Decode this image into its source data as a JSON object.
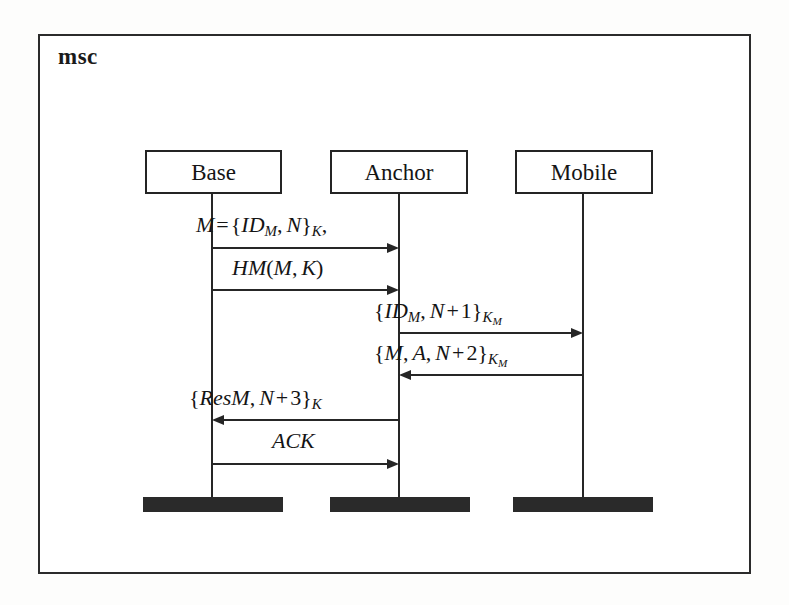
{
  "figure": {
    "kind": "message-sequence-chart",
    "frame_label": "msc"
  },
  "instances": [
    {
      "id": "base",
      "label": "Base",
      "box_x": 145,
      "box_y": 150,
      "box_w": 137,
      "lifeline_x": 212,
      "term_x": 143,
      "term_w": 140
    },
    {
      "id": "anchor",
      "label": "Anchor",
      "box_x": 330,
      "box_y": 150,
      "box_w": 138,
      "lifeline_x": 399,
      "term_x": 330,
      "term_w": 140
    },
    {
      "id": "mobile",
      "label": "Mobile",
      "box_x": 515,
      "box_y": 150,
      "box_w": 138,
      "lifeline_x": 583,
      "term_x": 513,
      "term_w": 140
    }
  ],
  "lifeline": {
    "top": 194,
    "bottom": 497
  },
  "terminators": {
    "top": 497,
    "height": 15
  },
  "messages": [
    {
      "index": 1,
      "from": "base",
      "to": "anchor",
      "direction": "right",
      "y": 247,
      "label_plain": "M = {ID_M, N}_K,",
      "label_x": 196,
      "label_y": 214
    },
    {
      "index": 2,
      "from": "base",
      "to": "anchor",
      "direction": "right",
      "y": 289,
      "label_plain": "HM(M, K)",
      "label_x": 232,
      "label_y": 257
    },
    {
      "index": 3,
      "from": "anchor",
      "to": "mobile",
      "direction": "right",
      "y": 332,
      "label_plain": "{ID_M, N + 1}_K_M",
      "label_x": 374,
      "label_y": 300
    },
    {
      "index": 4,
      "from": "mobile",
      "to": "anchor",
      "direction": "left",
      "y": 374,
      "label_plain": "{M, A, N + 2}_K_M",
      "label_x": 374,
      "label_y": 342
    },
    {
      "index": 5,
      "from": "anchor",
      "to": "base",
      "direction": "left",
      "y": 419,
      "label_plain": "{ResM, N + 3}_K",
      "label_x": 189,
      "label_y": 387
    },
    {
      "index": 6,
      "from": "base",
      "to": "anchor",
      "direction": "right",
      "y": 463,
      "label_plain": "ACK",
      "label_x": 272,
      "label_y": 430
    }
  ],
  "tokens": {
    "M": "M",
    "A": "A",
    "N": "N",
    "K": "K",
    "ID": "ID",
    "HM": "HM",
    "ResM": "ResM",
    "ACK": "ACK",
    "eq": "=",
    "plus": "+",
    "lbrace": "{",
    "rbrace": "}",
    "lparen": "(",
    "rparen": ")",
    "comma": ",",
    "one": "1",
    "two": "2",
    "three": "3",
    "sub_M": "M",
    "sub_K": "K",
    "sub_KM_K": "K",
    "sub_KM_M": "M"
  },
  "colors": {
    "ink": "#262626",
    "frame": "#2b2b2b",
    "paper": "#ffffff",
    "page_bg": "#fdfdfc",
    "terminator_fill": "#2a2a2a"
  }
}
